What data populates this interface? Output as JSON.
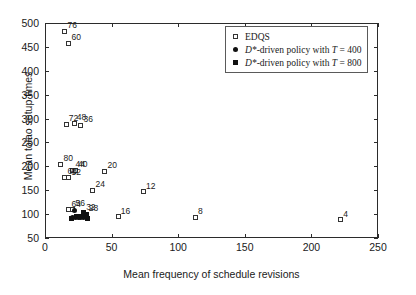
{
  "chart_data": {
    "type": "scatter",
    "title": "",
    "xlabel": "Mean frequency of schedule revisions",
    "ylabel": "Mean tolao setup times",
    "xlim": [
      0,
      250
    ],
    "ylim": [
      50,
      500
    ],
    "xticks": [
      0,
      50,
      100,
      150,
      200,
      250
    ],
    "yticks": [
      50,
      100,
      150,
      200,
      250,
      300,
      350,
      400,
      450,
      500
    ],
    "grid": false,
    "legend_position": "top-right",
    "series": [
      {
        "name": "EDQS",
        "marker": "open-square",
        "points": [
          {
            "label": "76",
            "x": 15,
            "y": 483
          },
          {
            "label": "60",
            "x": 18,
            "y": 458
          },
          {
            "label": "72",
            "x": 16,
            "y": 288
          },
          {
            "label": "48",
            "x": 22,
            "y": 290
          },
          {
            "label": "36",
            "x": 27,
            "y": 286
          },
          {
            "label": "80",
            "x": 12,
            "y": 204
          },
          {
            "label": "44",
            "x": 21,
            "y": 192
          },
          {
            "label": "40",
            "x": 23,
            "y": 192
          },
          {
            "label": "68",
            "x": 15,
            "y": 177
          },
          {
            "label": "52",
            "x": 18,
            "y": 176
          },
          {
            "label": "20",
            "x": 45,
            "y": 190
          },
          {
            "label": "24",
            "x": 36,
            "y": 150
          },
          {
            "label": "12",
            "x": 74,
            "y": 147
          },
          {
            "label": "64",
            "x": 18,
            "y": 109
          },
          {
            "label": "56",
            "x": 21,
            "y": 110
          },
          {
            "label": "16",
            "x": 55,
            "y": 94
          },
          {
            "label": "8",
            "x": 113,
            "y": 93
          },
          {
            "label": "4",
            "x": 222,
            "y": 88
          }
        ]
      },
      {
        "name": "D*-driven policy with T = 400",
        "marker": "filled-circle",
        "points": [
          {
            "x": 22,
            "y": 108
          },
          {
            "x": 21,
            "y": 92
          },
          {
            "x": 23,
            "y": 92
          },
          {
            "x": 25,
            "y": 92
          },
          {
            "x": 27,
            "y": 93
          },
          {
            "x": 29,
            "y": 93
          }
        ]
      },
      {
        "name": "D*-driven policy with T = 800",
        "marker": "filled-square",
        "points": [
          {
            "label": "32",
            "x": 29,
            "y": 103
          },
          {
            "label": "28",
            "x": 31,
            "y": 100
          },
          {
            "x": 24,
            "y": 96
          },
          {
            "x": 26,
            "y": 96
          },
          {
            "x": 28,
            "y": 96
          },
          {
            "x": 30,
            "y": 95
          },
          {
            "x": 32,
            "y": 91
          },
          {
            "x": 20,
            "y": 91
          }
        ]
      }
    ]
  },
  "legend": {
    "items": [
      {
        "symbol": "open-square",
        "text": "EDQS",
        "italic_prefix": ""
      },
      {
        "symbol": "filled-circle",
        "text": "-driven policy with ",
        "italic_prefix": "D*",
        "suffix": "T = 400"
      },
      {
        "symbol": "filled-square",
        "text": "-driven policy with ",
        "italic_prefix": "D*",
        "suffix": "T = 800"
      }
    ],
    "line1": "EDQS",
    "line2_a": "D*",
    "line2_b": "-driven policy with ",
    "line2_c": "T",
    "line2_d": " = 400",
    "line3_a": "D*",
    "line3_b": "-driven policy with ",
    "line3_c": "T",
    "line3_d": " = 800"
  }
}
